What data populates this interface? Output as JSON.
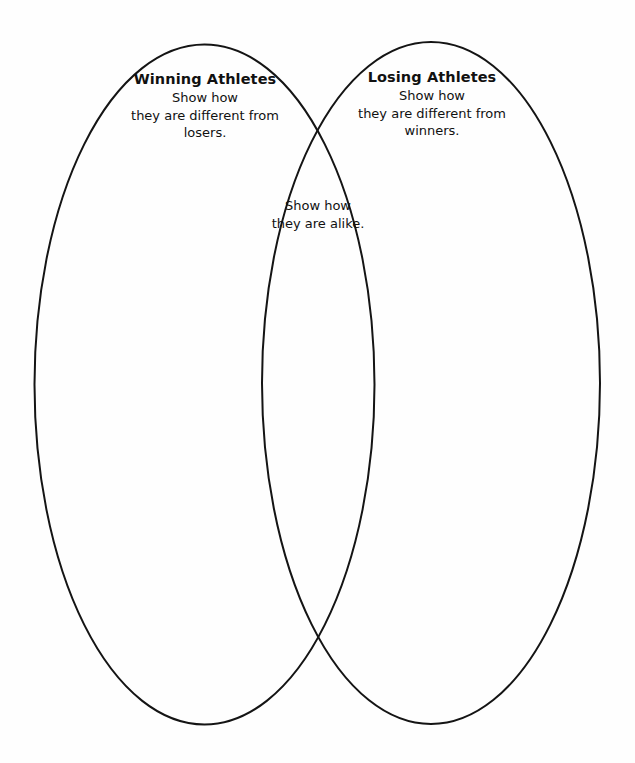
{
  "diagram": {
    "type": "venn-two-circle",
    "title_present": false,
    "background_color": "#fefefe",
    "stroke_color": "#141414",
    "stroke_width": 2,
    "left_set": {
      "heading": "Winning Athletes",
      "body_lines": [
        "Show how",
        "they are different from",
        "losers."
      ],
      "ellipse": {
        "cx": 204.5,
        "cy": 384.5,
        "rx": 170,
        "ry": 340
      }
    },
    "right_set": {
      "heading": "Losing Athletes",
      "body_lines": [
        "Show how",
        "they are different from",
        "winners."
      ],
      "ellipse": {
        "cx": 431,
        "cy": 383,
        "rx": 169,
        "ry": 341
      }
    },
    "intersection": {
      "heading": "",
      "body_lines": [
        "Show how",
        "they are alike."
      ]
    }
  }
}
